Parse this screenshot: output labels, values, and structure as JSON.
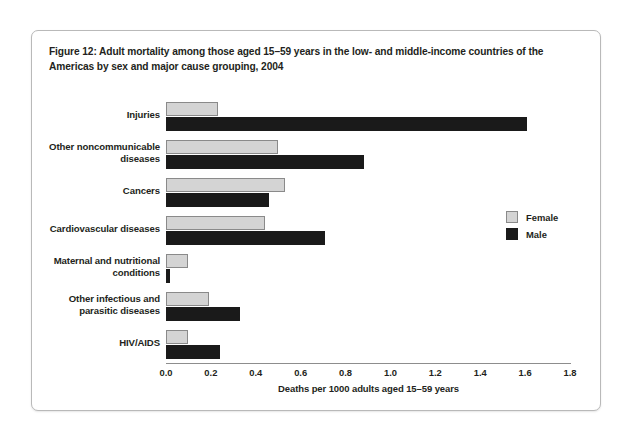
{
  "figure": {
    "caption": "Figure 12: Adult mortality among those aged 15–59 years in the low- and middle-income countries of the Americas by sex and major cause grouping, 2004"
  },
  "legend": {
    "female_label": "Female",
    "male_label": "Male",
    "female_color": "#d4d4d4",
    "male_color": "#1a1a1a"
  },
  "chart_data": {
    "type": "bar",
    "orientation": "horizontal",
    "title": "Figure 12: Adult mortality among those aged 15–59 years in the low- and middle-income countries of the Americas by sex and major cause grouping, 2004",
    "xlabel": "Deaths per 1000 adults aged 15–59 years",
    "ylabel": "",
    "xlim": [
      0.0,
      1.8
    ],
    "xticks": [
      "0.0",
      "0.2",
      "0.4",
      "0.6",
      "0.8",
      "1.0",
      "1.2",
      "1.4",
      "1.6",
      "1.8"
    ],
    "xtick_values": [
      0.0,
      0.2,
      0.4,
      0.6,
      0.8,
      1.0,
      1.2,
      1.4,
      1.6,
      1.8
    ],
    "grid": false,
    "legend_position": "right",
    "categories": [
      "Injuries",
      "Other noncommunicable diseases",
      "Cancers",
      "Cardiovascular diseases",
      "Maternal and nutritional conditions",
      "Other infectious and parasitic diseases",
      "HIV/AIDS"
    ],
    "category_lines": [
      [
        "Injuries"
      ],
      [
        "Other noncommunicable",
        "diseases"
      ],
      [
        "Cancers"
      ],
      [
        "Cardiovascular diseases"
      ],
      [
        "Maternal and nutritional",
        "conditions"
      ],
      [
        "Other infectious and",
        "parasitic diseases"
      ],
      [
        "HIV/AIDS"
      ]
    ],
    "series": [
      {
        "name": "Female",
        "color": "#d4d4d4",
        "values": [
          0.23,
          0.5,
          0.53,
          0.44,
          0.1,
          0.19,
          0.1
        ]
      },
      {
        "name": "Male",
        "color": "#1a1a1a",
        "values": [
          1.61,
          0.88,
          0.46,
          0.71,
          0.02,
          0.33,
          0.24
        ]
      }
    ]
  }
}
